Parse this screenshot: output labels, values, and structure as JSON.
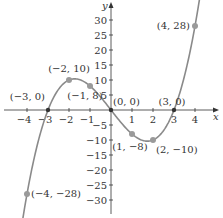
{
  "chart_data": {
    "type": "line",
    "title": "",
    "function": "y = x^3 - 9x",
    "xlabel": "x",
    "ylabel": "y",
    "xlim": [
      -4.6,
      4.6
    ],
    "ylim": [
      -33,
      33
    ],
    "grid": false,
    "legend": null,
    "x_ticks": [
      -4,
      -3,
      -2,
      -1,
      1,
      2,
      3,
      4
    ],
    "x_tick_labels": [
      "−4",
      "−3",
      "−2",
      "−1",
      "1",
      "2",
      "3",
      "4"
    ],
    "y_ticks": [
      30,
      25,
      20,
      15,
      10,
      5,
      -5,
      -10,
      -15,
      -20,
      -25,
      -30
    ],
    "y_tick_labels": [
      "30",
      "25",
      "20",
      "15",
      "10",
      "5",
      "−5",
      "−10",
      "−15",
      "−20",
      "−25",
      "−30"
    ],
    "points": [
      {
        "x": -4,
        "y": -28,
        "label": "(−4, −28)"
      },
      {
        "x": -3,
        "y": 0,
        "label": "(−3, 0)"
      },
      {
        "x": -2,
        "y": 10,
        "label": "(−2, 10)"
      },
      {
        "x": -1,
        "y": 8,
        "label": "(−1, 8)"
      },
      {
        "x": 0,
        "y": 0,
        "label": "(0, 0)"
      },
      {
        "x": 1,
        "y": -8,
        "label": "(1, −8)"
      },
      {
        "x": 2,
        "y": -10,
        "label": "(2, −10)"
      },
      {
        "x": 3,
        "y": 0,
        "label": "(3, 0)"
      },
      {
        "x": 4,
        "y": 28,
        "label": "(4, 28)"
      }
    ],
    "curve_x_range": [
      -4.2,
      4.3
    ],
    "colors": {
      "curve": "#8a8a8a",
      "point": "#9a9a9a",
      "axis": "#333333",
      "text": "#333333"
    }
  }
}
